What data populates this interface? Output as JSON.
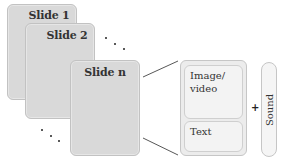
{
  "slides": [
    {
      "id": "slide-1",
      "label": "Slide 1"
    },
    {
      "id": "slide-2",
      "label": "Slide 2"
    },
    {
      "id": "slide-n",
      "label": "Slide n"
    }
  ],
  "ellipsis": {
    "top_right": "· · ·",
    "bottom_left": "· · ·"
  },
  "detail": {
    "media_label": "Image/ video",
    "text_label": "Text",
    "plus": "+",
    "sound_label": "Sound"
  },
  "colors": {
    "slide_fill": "#d9d9d9",
    "panel_fill": "#ececec",
    "inner_fill": "#f3f3f3",
    "border": "#c6c6c6",
    "line": "#444444"
  }
}
